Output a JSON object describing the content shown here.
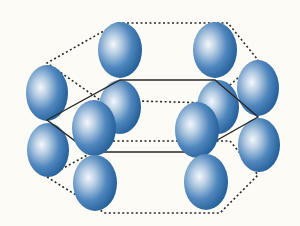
{
  "diagram": {
    "title": "",
    "type": "hexagonal close-packed crystal structure",
    "colors": {
      "background": "#fcfbf5",
      "sphere_light": "#eef3f8",
      "sphere_mid": "#4f86bd",
      "sphere_dark": "#1f5a95",
      "line": "#2a2a2a"
    },
    "hexagons": [
      {
        "name": "top-hexagon",
        "style": "dotted",
        "points": [
          [
            118,
            23
          ],
          [
            228,
            23
          ],
          [
            258,
            60
          ],
          [
            210,
            103
          ],
          [
            100,
            100
          ],
          [
            47,
            63
          ]
        ]
      },
      {
        "name": "middle-hexagon",
        "style": "solid",
        "points": [
          [
            120,
            80
          ],
          [
            215,
            80
          ],
          [
            258,
            117
          ],
          [
            196,
            152
          ],
          [
            90,
            152
          ],
          [
            47,
            120
          ]
        ]
      },
      {
        "name": "bottom-hexagon",
        "style": "dotted",
        "points": [
          [
            113,
            141
          ],
          [
            230,
            141
          ],
          [
            258,
            175
          ],
          [
            220,
            213
          ],
          [
            105,
            213
          ],
          [
            47,
            177
          ]
        ]
      }
    ],
    "spheres": [
      {
        "name": "sphere-top-back-left",
        "cx": 120,
        "cy": 50,
        "rx": 22,
        "ry": 28
      },
      {
        "name": "sphere-top-back-right",
        "cx": 215,
        "cy": 50,
        "rx": 22,
        "ry": 28
      },
      {
        "name": "sphere-mid-back-left",
        "cx": 120,
        "cy": 107,
        "rx": 21,
        "ry": 27
      },
      {
        "name": "sphere-mid-back-right",
        "cx": 218,
        "cy": 107,
        "rx": 21,
        "ry": 27
      },
      {
        "name": "sphere-top-left",
        "cx": 47,
        "cy": 93,
        "rx": 21,
        "ry": 28
      },
      {
        "name": "sphere-top-right",
        "cx": 258,
        "cy": 88,
        "rx": 21,
        "ry": 28
      },
      {
        "name": "sphere-bottom-left",
        "cx": 48,
        "cy": 150,
        "rx": 21,
        "ry": 27
      },
      {
        "name": "sphere-bottom-right",
        "cx": 259,
        "cy": 145,
        "rx": 21,
        "ry": 27
      },
      {
        "name": "sphere-mid-front-left",
        "cx": 94,
        "cy": 128,
        "rx": 22,
        "ry": 28
      },
      {
        "name": "sphere-mid-front-right",
        "cx": 197,
        "cy": 130,
        "rx": 22,
        "ry": 28
      },
      {
        "name": "sphere-bottom-front-left",
        "cx": 95,
        "cy": 183,
        "rx": 22,
        "ry": 28
      },
      {
        "name": "sphere-bottom-front-right",
        "cx": 206,
        "cy": 182,
        "rx": 22,
        "ry": 28
      }
    ]
  }
}
